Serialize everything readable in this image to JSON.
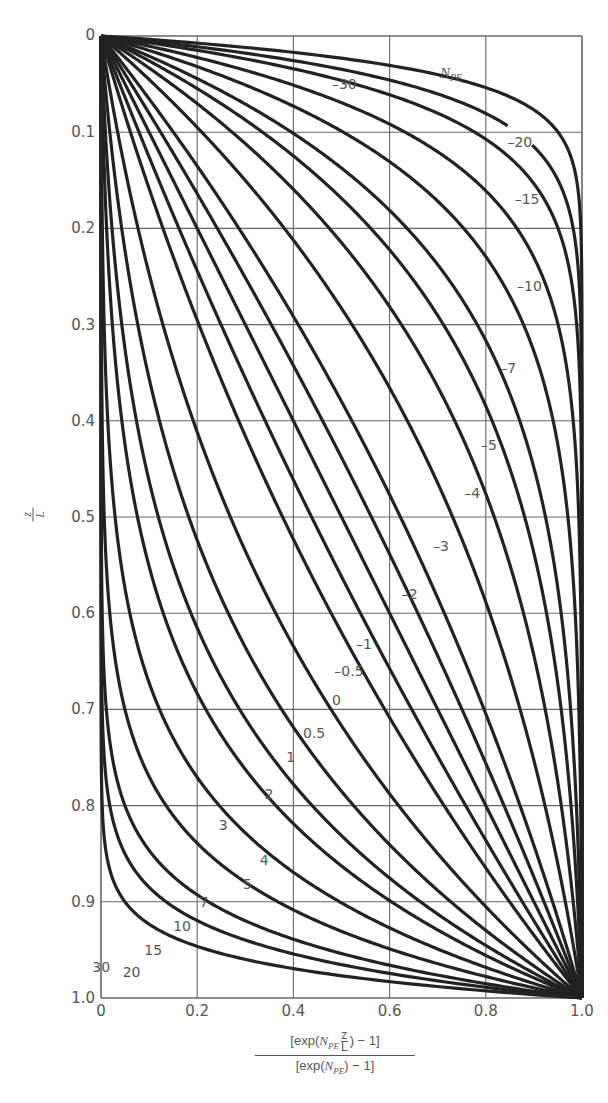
{
  "chart_data": {
    "type": "line",
    "title": "",
    "xlabel": "[exp(N_PE z/L) - 1] / [exp(N_PE) - 1]",
    "ylabel": "z/L",
    "xlim": [
      0,
      1.0
    ],
    "ylim": [
      0,
      1.0
    ],
    "y_inverted": true,
    "grid": true,
    "x_ticks": [
      "0",
      "0.2",
      "0.4",
      "0.6",
      "0.8",
      "1.0"
    ],
    "y_ticks": [
      "0",
      "0.1",
      "0.2",
      "0.3",
      "0.4",
      "0.5",
      "0.6",
      "0.7",
      "0.8",
      "0.9",
      "1.0"
    ],
    "legend_title": "N_PE",
    "function": "x = (exp(N_PE * y) - 1) / (exp(N_PE) - 1), y = z/L",
    "series": [
      {
        "name": "-30",
        "N": -30,
        "label_pos": [
          0.48,
          0.055
        ]
      },
      {
        "name": "-20",
        "N": -20,
        "label_pos": [
          0.845,
          0.115
        ]
      },
      {
        "name": "-15",
        "N": -15,
        "label_pos": [
          0.86,
          0.175
        ]
      },
      {
        "name": "-10",
        "N": -10,
        "label_pos": [
          0.865,
          0.265
        ]
      },
      {
        "name": "-7",
        "N": -7,
        "label_pos": [
          0.83,
          0.35
        ]
      },
      {
        "name": "-5",
        "N": -5,
        "label_pos": [
          0.79,
          0.43
        ]
      },
      {
        "name": "-4",
        "N": -4,
        "label_pos": [
          0.755,
          0.48
        ]
      },
      {
        "name": "-3",
        "N": -3,
        "label_pos": [
          0.69,
          0.535
        ]
      },
      {
        "name": "-2",
        "N": -2,
        "label_pos": [
          0.625,
          0.585
        ]
      },
      {
        "name": "-1",
        "N": -1,
        "label_pos": [
          0.53,
          0.637
        ]
      },
      {
        "name": "-0.5",
        "N": -0.5,
        "label_pos": [
          0.485,
          0.665
        ]
      },
      {
        "name": "0",
        "N": 0,
        "label_pos": [
          0.48,
          0.695
        ]
      },
      {
        "name": "0.5",
        "N": 0.5,
        "label_pos": [
          0.42,
          0.73
        ]
      },
      {
        "name": "1",
        "N": 1,
        "label_pos": [
          0.385,
          0.755
        ]
      },
      {
        "name": "2",
        "N": 2,
        "label_pos": [
          0.34,
          0.793
        ]
      },
      {
        "name": "3",
        "N": 3,
        "label_pos": [
          0.245,
          0.825
        ]
      },
      {
        "name": "4",
        "N": 4,
        "label_pos": [
          0.33,
          0.862
        ]
      },
      {
        "name": "5",
        "N": 5,
        "label_pos": [
          0.295,
          0.887
        ]
      },
      {
        "name": "7",
        "N": 7,
        "label_pos": [
          0.205,
          0.905
        ]
      },
      {
        "name": "10",
        "N": 10,
        "label_pos": [
          0.15,
          0.93
        ]
      },
      {
        "name": "15",
        "N": 15,
        "label_pos": [
          0.09,
          0.955
        ]
      },
      {
        "name": "20",
        "N": 20,
        "label_pos": [
          0.045,
          0.978
        ]
      },
      {
        "name": "30",
        "N": 30,
        "label_pos": [
          -0.018,
          0.973
        ]
      }
    ]
  },
  "axis": {
    "y_label_top": "z",
    "y_label_bottom": "L",
    "x_label_num_prefix": "[exp(",
    "x_label_N": "N",
    "x_label_sub": "PE",
    "x_label_frac_top": "z",
    "x_label_frac_bottom": "L",
    "x_label_num_suffix": ") − 1]",
    "x_label_den_prefix": "[exp(",
    "x_label_den_suffix": ") − 1]",
    "legend_title_N": "N",
    "legend_title_sub": "PE"
  }
}
